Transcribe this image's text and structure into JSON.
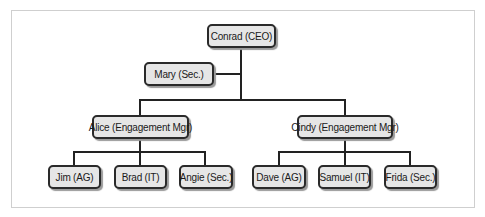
{
  "org_chart": {
    "ceo": {
      "label": "Conrad (CEO)"
    },
    "assistant": {
      "label": "Mary (Sec.)"
    },
    "managers": [
      {
        "label": "Alice (Engagement Mgr)",
        "reports": [
          {
            "label": "Jim (AG)"
          },
          {
            "label": "Brad (IT)"
          },
          {
            "label": "Angie (Sec.)"
          }
        ]
      },
      {
        "label": "Cindy (Engagement Mgr)",
        "reports": [
          {
            "label": "Dave (AG)"
          },
          {
            "label": "Samuel (IT)"
          },
          {
            "label": "Frida (Sec.)"
          }
        ]
      }
    ]
  },
  "colors": {
    "node_fill": "#e6e6e6",
    "node_border": "#2a2a2a",
    "connector": "#222222",
    "frame": "#cfcfcf"
  }
}
